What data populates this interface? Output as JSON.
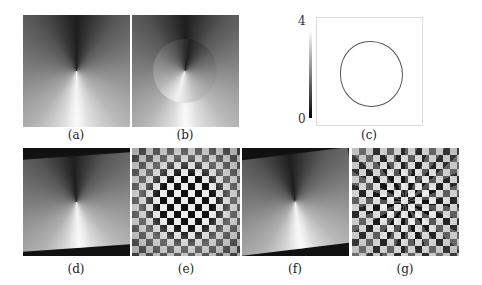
{
  "figure": {
    "panels": [
      {
        "id": "a",
        "label": "(a)",
        "description": "grayscale angular (conic) gradient field"
      },
      {
        "id": "b",
        "label": "(b)",
        "description": "conic gradient with rotated disk region"
      },
      {
        "id": "c",
        "label": "(c)",
        "description": "difference map showing circular boundary"
      },
      {
        "id": "d",
        "label": "(d)",
        "description": "warped conic gradient field, rotated"
      },
      {
        "id": "e",
        "label": "(e)",
        "description": "checkerboard with radial swirl distortion"
      },
      {
        "id": "f",
        "label": "(f)",
        "description": "warped conic gradient field, rotated"
      },
      {
        "id": "g",
        "label": "(g)",
        "description": "checkerboard with strong spiral distortion"
      }
    ],
    "colorbar": {
      "max_label": "4",
      "min_label": "0"
    }
  }
}
